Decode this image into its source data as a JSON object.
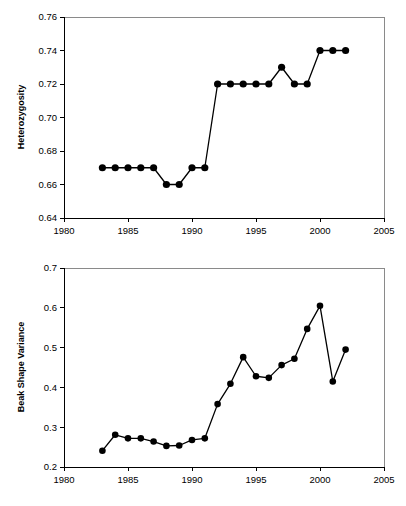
{
  "figure": {
    "background_color": "#ffffff",
    "foreground_color": "#000000",
    "frame_color": "#8a8a8a",
    "panel_count": 2
  },
  "chart_data": [
    {
      "id": "heterozygosity-panel",
      "type": "line",
      "title": "",
      "xlabel": "",
      "ylabel": "Heterozygosity",
      "xlim": [
        1980,
        2005
      ],
      "ylim": [
        0.64,
        0.76
      ],
      "xticks": [
        1980,
        1985,
        1990,
        1995,
        2000,
        2005
      ],
      "xtick_labels": [
        "1980",
        "1985",
        "1990",
        "1995",
        "2000",
        "2005"
      ],
      "yticks": [
        0.64,
        0.66,
        0.68,
        0.7,
        0.72,
        0.74,
        0.76
      ],
      "ytick_labels": [
        "0.64",
        "0.66",
        "0.68",
        "0.70",
        "0.72",
        "0.74",
        "0.76"
      ],
      "grid": false,
      "legend": false,
      "marker": "filled-circle",
      "x": [
        1983,
        1984,
        1985,
        1986,
        1987,
        1988,
        1989,
        1990,
        1991,
        1992,
        1993,
        1994,
        1995,
        1996,
        1997,
        1998,
        1999,
        2000,
        2001,
        2002
      ],
      "values": [
        0.67,
        0.67,
        0.67,
        0.67,
        0.67,
        0.66,
        0.66,
        0.67,
        0.67,
        0.72,
        0.72,
        0.72,
        0.72,
        0.72,
        0.73,
        0.72,
        0.72,
        0.74,
        0.74,
        0.74
      ]
    },
    {
      "id": "beak-shape-variance-panel",
      "type": "line",
      "title": "",
      "xlabel": "",
      "ylabel": "Beak Shape Variance",
      "xlim": [
        1980,
        2005
      ],
      "ylim": [
        0.2,
        0.7
      ],
      "xticks": [
        1980,
        1985,
        1990,
        1995,
        2000,
        2005
      ],
      "xtick_labels": [
        "1980",
        "1985",
        "1990",
        "1995",
        "2000",
        "2005"
      ],
      "yticks": [
        0.2,
        0.3,
        0.4,
        0.5,
        0.6,
        0.7
      ],
      "ytick_labels": [
        "0.2",
        "0.3",
        "0.4",
        "0.5",
        "0.6",
        "0.7"
      ],
      "grid": false,
      "legend": false,
      "marker": "filled-circle",
      "x": [
        1983,
        1984,
        1985,
        1986,
        1987,
        1988,
        1989,
        1990,
        1991,
        1992,
        1993,
        1994,
        1995,
        1996,
        1997,
        1998,
        1999,
        2000,
        2001,
        2002
      ],
      "values": [
        0.241,
        0.281,
        0.272,
        0.272,
        0.264,
        0.253,
        0.254,
        0.268,
        0.272,
        0.358,
        0.409,
        0.476,
        0.428,
        0.424,
        0.456,
        0.472,
        0.547,
        0.605,
        0.415,
        0.495
      ]
    }
  ]
}
